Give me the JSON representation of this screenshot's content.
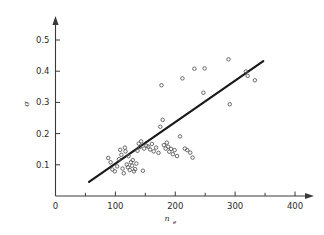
{
  "chart_data": {
    "type": "scatter",
    "title": "",
    "subtitle": "",
    "xlabel": "n_e",
    "xlabel_base": "n",
    "xlabel_subscript": "e",
    "ylabel": "σ",
    "xlim": [
      0,
      420
    ],
    "ylim": [
      0,
      0.56
    ],
    "x_ticks": [
      0,
      100,
      200,
      300,
      400
    ],
    "x_tick_labels": [
      "0",
      "100",
      "200",
      "300",
      "400"
    ],
    "x_minor_ticks": [
      50,
      150,
      250,
      350
    ],
    "y_ticks": [
      0.1,
      0.2,
      0.3,
      0.4,
      0.5
    ],
    "y_tick_labels": [
      "0.1",
      "0.2",
      "0.3",
      "0.4",
      "0.5"
    ],
    "grid": false,
    "legend": null,
    "legend_position": "none",
    "marker": "open-circle",
    "marker_color": "#5a5a5a",
    "line_color": "#1a1a1a",
    "axis_color": "#3a3a3a",
    "series": [
      {
        "name": "observations",
        "type": "scatter",
        "points": [
          [
            88,
            0.122
          ],
          [
            92,
            0.108
          ],
          [
            95,
            0.085
          ],
          [
            99,
            0.079
          ],
          [
            103,
            0.095
          ],
          [
            106,
            0.118
          ],
          [
            108,
            0.148
          ],
          [
            110,
            0.132
          ],
          [
            112,
            0.088
          ],
          [
            114,
            0.073
          ],
          [
            116,
            0.155
          ],
          [
            117,
            0.143
          ],
          [
            119,
            0.101
          ],
          [
            121,
            0.092
          ],
          [
            122,
            0.128
          ],
          [
            124,
            0.083
          ],
          [
            126,
            0.108
          ],
          [
            128,
            0.097
          ],
          [
            129,
            0.115
          ],
          [
            131,
            0.079
          ],
          [
            133,
            0.086
          ],
          [
            135,
            0.104
          ],
          [
            137,
            0.145
          ],
          [
            139,
            0.168
          ],
          [
            141,
            0.157
          ],
          [
            143,
            0.175
          ],
          [
            146,
            0.081
          ],
          [
            148,
            0.152
          ],
          [
            152,
            0.161
          ],
          [
            155,
            0.158
          ],
          [
            158,
            0.149
          ],
          [
            161,
            0.167
          ],
          [
            164,
            0.143
          ],
          [
            168,
            0.155
          ],
          [
            172,
            0.138
          ],
          [
            175,
            0.222
          ],
          [
            177,
            0.355
          ],
          [
            179,
            0.244
          ],
          [
            181,
            0.163
          ],
          [
            184,
            0.152
          ],
          [
            186,
            0.171
          ],
          [
            188,
            0.158
          ],
          [
            190,
            0.142
          ],
          [
            193,
            0.151
          ],
          [
            196,
            0.134
          ],
          [
            199,
            0.147
          ],
          [
            203,
            0.128
          ],
          [
            208,
            0.191
          ],
          [
            212,
            0.377
          ],
          [
            216,
            0.152
          ],
          [
            220,
            0.147
          ],
          [
            225,
            0.139
          ],
          [
            229,
            0.123
          ],
          [
            232,
            0.408
          ],
          [
            247,
            0.331
          ],
          [
            249,
            0.409
          ],
          [
            289,
            0.438
          ],
          [
            291,
            0.294
          ],
          [
            318,
            0.399
          ],
          [
            321,
            0.385
          ],
          [
            333,
            0.371
          ]
        ]
      }
    ],
    "fit_line": {
      "name": "linear-fit",
      "x_start": 56,
      "y_start": 0.045,
      "x_end": 347,
      "y_end": 0.432
    }
  }
}
